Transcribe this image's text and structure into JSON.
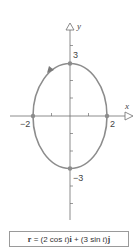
{
  "diagram": {
    "axes": {
      "x_label": "x",
      "y_label": "y"
    },
    "tick_labels": {
      "x_neg": "−2",
      "x_pos": "2",
      "y_pos": "3",
      "y_neg": "−3"
    },
    "curve": {
      "type": "ellipse",
      "center": [
        0,
        0
      ],
      "semi_axis_x": 2,
      "semi_axis_y": 3,
      "direction": "counterclockwise",
      "marked_points": [
        [
          2,
          0
        ],
        [
          0,
          3
        ],
        [
          -2,
          0
        ],
        [
          0,
          -3
        ]
      ]
    },
    "colors": {
      "curve": "#8c8c8c",
      "axis": "#6e6e6e",
      "point": "#8c8c8c"
    },
    "equation": {
      "r": "r",
      "eq": " = (2 cos ",
      "t1": "t",
      "mid1": ")",
      "i": "i",
      "plus": " + (3 sin ",
      "t2": "t",
      "mid2": ")",
      "j": "j"
    }
  }
}
